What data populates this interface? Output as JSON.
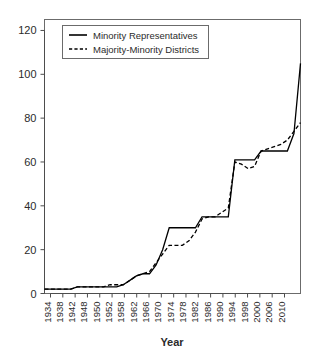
{
  "chart_data": {
    "type": "line",
    "title": "",
    "xlabel": "Year",
    "ylabel": "",
    "xlim": [
      1934,
      2012
    ],
    "ylim": [
      0,
      125
    ],
    "grid": false,
    "legend_position": "top-left",
    "yticks": [
      0,
      20,
      40,
      60,
      80,
      100,
      120
    ],
    "ytick_labels": [
      "0",
      "20",
      "40",
      "60",
      "80",
      "100",
      "120"
    ],
    "xtick_labels": [
      "1934",
      "1938",
      "1942",
      "1948",
      "1950",
      "1952",
      "1958",
      "1962",
      "1966",
      "1970",
      "1974",
      "1978",
      "1982",
      "1986",
      "1990",
      "1994",
      "1998",
      "2000",
      "2006",
      "2010"
    ],
    "x": [
      1934,
      1936,
      1938,
      1940,
      1942,
      1944,
      1946,
      1948,
      1950,
      1952,
      1954,
      1956,
      1958,
      1960,
      1962,
      1964,
      1966,
      1968,
      1970,
      1972,
      1974,
      1976,
      1978,
      1980,
      1982,
      1984,
      1986,
      1988,
      1990,
      1992,
      1994,
      1996,
      1998,
      2000,
      2002,
      2004,
      2006,
      2008,
      2010,
      2012
    ],
    "series": [
      {
        "name": "Minority Representatives",
        "style": "solid",
        "color": "#000000",
        "values": [
          2,
          2,
          2,
          2,
          2,
          3,
          3,
          3,
          3,
          3,
          3,
          3,
          4,
          6,
          8,
          9,
          9,
          13,
          20,
          30,
          30,
          30,
          30,
          30,
          35,
          35,
          35,
          35,
          35,
          61,
          61,
          61,
          61,
          65,
          65,
          65,
          65,
          65,
          73,
          105
        ]
      },
      {
        "name": "Majority-Minority Districts",
        "style": "dashed",
        "color": "#000000",
        "values": [
          2,
          2,
          2,
          2,
          2,
          3,
          3,
          3,
          3,
          3,
          4,
          4,
          4,
          6,
          8,
          9,
          10,
          14,
          18,
          22,
          22,
          22,
          24,
          28,
          34,
          35,
          35,
          37,
          39,
          60,
          59,
          57,
          58,
          65,
          66,
          67,
          68,
          70,
          74,
          78
        ]
      }
    ]
  },
  "legend": {
    "entries": [
      {
        "label": "Minority Representatives",
        "style": "solid"
      },
      {
        "label": "Majority-Minority Districts",
        "style": "dashed"
      }
    ]
  },
  "axis": {
    "x_title": "Year"
  }
}
